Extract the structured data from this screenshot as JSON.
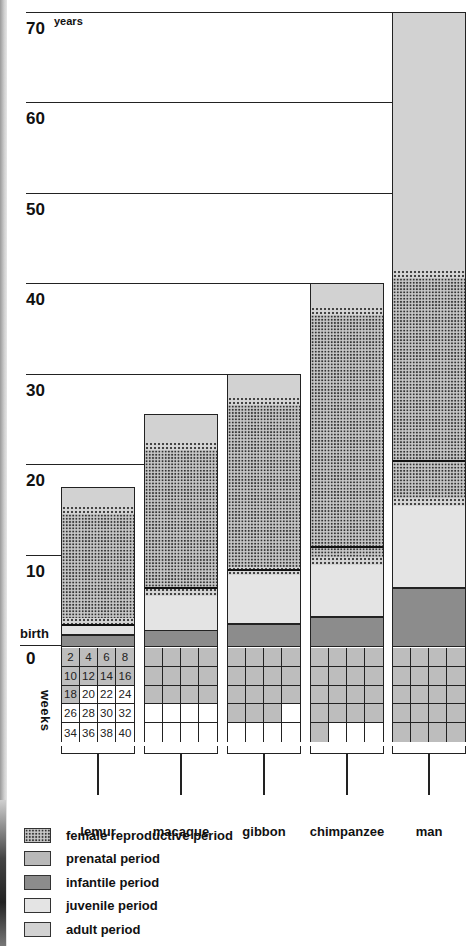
{
  "chart_data": {
    "type": "bar",
    "subtype": "stacked-life-period",
    "title": "",
    "ylabel": "years",
    "ylim": [
      0,
      70
    ],
    "yticks": [
      "0",
      "10",
      "20",
      "30",
      "40",
      "50",
      "60",
      "70"
    ],
    "ytick_unit_label": "years",
    "birth_label": "birth",
    "weeks_label": "weeks",
    "week_grid_numbers": [
      [
        "2",
        "4",
        "6",
        "8"
      ],
      [
        "10",
        "12",
        "14",
        "16"
      ],
      [
        "18",
        "20",
        "22",
        "24"
      ],
      [
        "26",
        "28",
        "30",
        "32"
      ],
      [
        "34",
        "36",
        "38",
        "40"
      ]
    ],
    "categories": [
      "lemur",
      "macaque",
      "gibbon",
      "chimpanzee",
      "man"
    ],
    "grid": true,
    "legend_position": "bottom-left",
    "series": [
      {
        "name": "prenatal period (weeks)",
        "values": [
          18,
          24,
          30,
          33,
          39
        ]
      },
      {
        "name": "infantile period (years)",
        "start": [
          0,
          0,
          0,
          0,
          0
        ],
        "end": [
          1.3,
          1.8,
          2.5,
          3.3,
          6.5
        ]
      },
      {
        "name": "juvenile period (years)",
        "start": [
          1.3,
          1.8,
          2.5,
          3.3,
          6.5
        ],
        "end": [
          2.2,
          5.5,
          7.8,
          9.0,
          15.5
        ]
      },
      {
        "name": "female reproductive period (years)",
        "start": [
          2.2,
          5.5,
          7.8,
          9.0,
          14.0
        ],
        "end": [
          15.5,
          22.5,
          27.5,
          37.5,
          41.5
        ]
      },
      {
        "name": "adult period (years)",
        "start": [
          2.2,
          6.5,
          8.5,
          11.0,
          20.5
        ],
        "end": [
          17.5,
          25.5,
          30.0,
          40.0,
          70.0
        ]
      }
    ],
    "adulthood_line_years": [
      2.4,
      6.5,
      8.5,
      11.0,
      20.5
    ],
    "lifespan_years": [
      17.5,
      25.5,
      30,
      40,
      70
    ],
    "legend": [
      {
        "key": "repro",
        "label": "female reproductive period"
      },
      {
        "key": "prenatal",
        "label": "prenatal period"
      },
      {
        "key": "infantile",
        "label": "infantile period"
      },
      {
        "key": "juvenile",
        "label": "juvenile period"
      },
      {
        "key": "adult",
        "label": "adult period"
      }
    ],
    "colors": {
      "prenatal": "#b9b9b9",
      "infantile": "#8c8c8c",
      "juvenile": "#e4e4e4",
      "adult": "#d2d2d2",
      "repro": "#c9c9c9"
    }
  }
}
